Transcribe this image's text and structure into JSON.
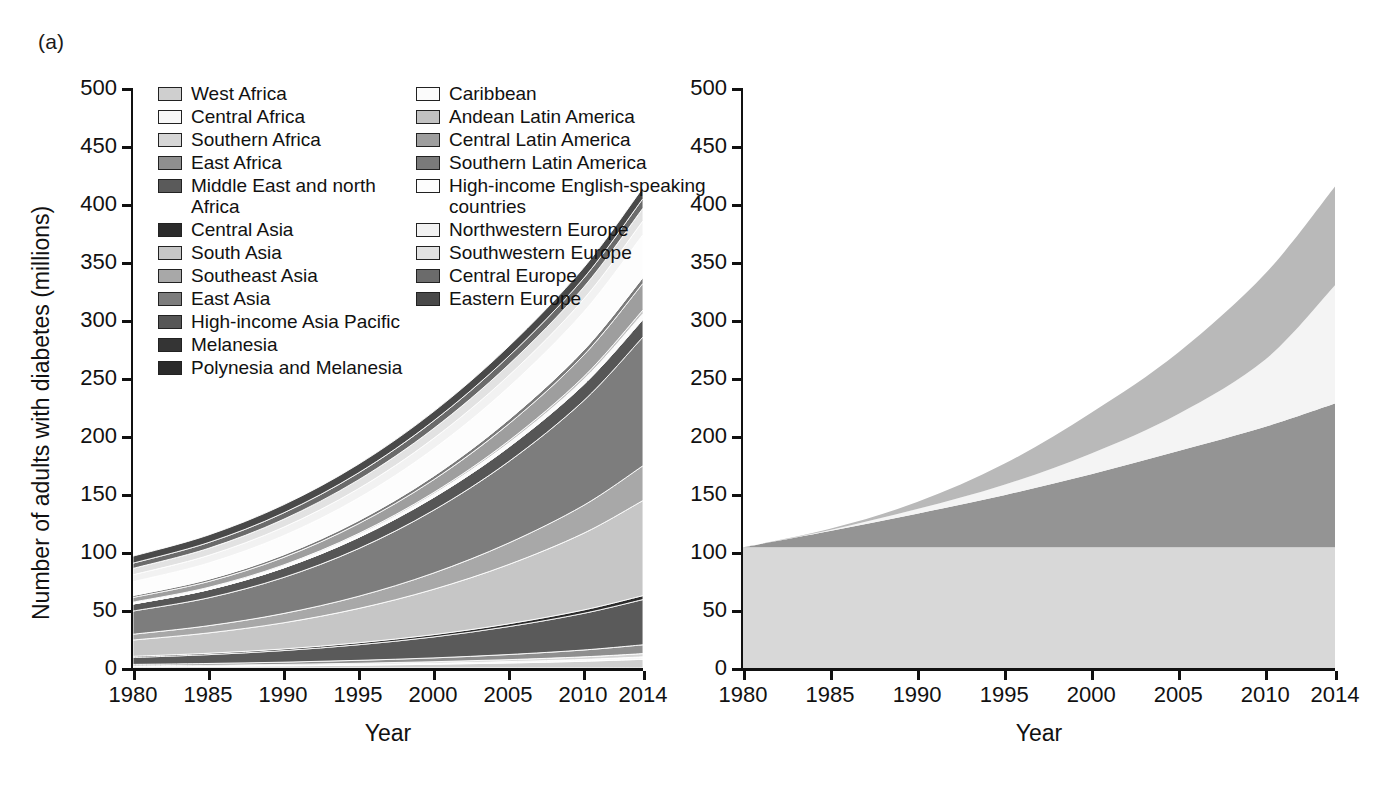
{
  "figure": {
    "panels": [
      {
        "tag": "(a)"
      },
      {
        "tag": "(b)"
      }
    ]
  },
  "panel_a": {
    "tag": "(a)",
    "ylabel": "Number of adults with diabetes (millions)",
    "xlabel": "Year",
    "yticks": [
      "0",
      "50",
      "100",
      "150",
      "200",
      "250",
      "300",
      "350",
      "400",
      "450",
      "500"
    ],
    "xticks": [
      "1980",
      "1985",
      "1990",
      "1995",
      "2000",
      "2005",
      "2010",
      "2014"
    ],
    "legend": [
      {
        "label": "West Africa",
        "color": "#cfcfcf"
      },
      {
        "label": "Central Africa",
        "color": "#f7f7f7"
      },
      {
        "label": "Southern Africa",
        "color": "#d6d6d6"
      },
      {
        "label": "East Africa",
        "color": "#8f8f8f"
      },
      {
        "label": "Middle East and north Africa",
        "color": "#5a5a5a"
      },
      {
        "label": "Central Asia",
        "color": "#2b2b2b"
      },
      {
        "label": "South Asia",
        "color": "#c6c6c6"
      },
      {
        "label": "Southeast Asia",
        "color": "#a8a8a8"
      },
      {
        "label": "East Asia",
        "color": "#7d7d7d"
      },
      {
        "label": "High-income Asia Pacific",
        "color": "#565656"
      },
      {
        "label": "Melanesia",
        "color": "#343434"
      },
      {
        "label": "Polynesia and Melanesia",
        "color": "#2a2a2a"
      },
      {
        "label": "Caribbean",
        "color": "#fbfbfb"
      },
      {
        "label": "Andean Latin America",
        "color": "#c2c2c2"
      },
      {
        "label": "Central Latin America",
        "color": "#9e9e9e"
      },
      {
        "label": "Southern Latin America",
        "color": "#7a7a7a"
      },
      {
        "label": "High-income English-speaking countries",
        "color": "#fdfdfd"
      },
      {
        "label": "Northwestern Europe",
        "color": "#f2f2f2"
      },
      {
        "label": "Southwestern Europe",
        "color": "#e2e2e2"
      },
      {
        "label": "Central Europe",
        "color": "#6b6b6b"
      },
      {
        "label": "Eastern Europe",
        "color": "#494949"
      }
    ]
  },
  "panel_b": {
    "tag": "(b)",
    "xlabel": "Year",
    "yticks": [
      "0",
      "50",
      "100",
      "150",
      "200",
      "250",
      "300",
      "350",
      "400",
      "450",
      "500"
    ],
    "xticks": [
      "1980",
      "1985",
      "1990",
      "1995",
      "2000",
      "2005",
      "2010",
      "2014"
    ],
    "legend": [
      {
        "label": "Change due to change in prevalence",
        "color": "#b9b9b9"
      },
      {
        "label": "Change due to interaction between change in prevalence\nand change in population size and age structure",
        "color": "#f4f4f4"
      },
      {
        "label": "Change due to change in population size and age structure",
        "color": "#949494"
      },
      {
        "label": "Number of adults with diabetes in 1980",
        "color": "#d8d8d8"
      }
    ]
  },
  "chart_data": {
    "type": "area",
    "title": "",
    "xlabel": "Year",
    "ylabel": "Number of adults with diabetes (millions)",
    "xlim": [
      1980,
      2014
    ],
    "ylim": [
      0,
      500
    ],
    "grid": false,
    "legend_position": "inside-top-left",
    "charts": [
      {
        "panel": "(a)",
        "type": "area",
        "stacked": true,
        "x": [
          1980,
          1985,
          1990,
          1995,
          2000,
          2005,
          2010,
          2014
        ],
        "total": [
          101,
          119,
          143,
          175,
          218,
          268,
          330,
          400
        ],
        "series": [
          {
            "name": "West Africa",
            "color": "#cfcfcf",
            "values": [
              1.1,
              1.4,
              1.8,
              2.4,
              3.2,
              4.3,
              5.8,
              7.5
            ]
          },
          {
            "name": "Central Africa",
            "color": "#f7f7f7",
            "values": [
              0.3,
              0.4,
              0.5,
              0.7,
              0.9,
              1.2,
              1.6,
              2.1
            ]
          },
          {
            "name": "Southern Africa",
            "color": "#d6d6d6",
            "values": [
              0.5,
              0.6,
              0.8,
              1.0,
              1.3,
              1.7,
              2.2,
              2.8
            ]
          },
          {
            "name": "East Africa",
            "color": "#8f8f8f",
            "values": [
              1.2,
              1.5,
              1.9,
              2.5,
              3.3,
              4.4,
              5.9,
              7.6
            ]
          },
          {
            "name": "Middle East and north Africa",
            "color": "#5a5a5a",
            "values": [
              6.0,
              7.6,
              10.0,
              13.4,
              18.0,
              24.0,
              31.5,
              39.0
            ]
          },
          {
            "name": "Central Asia",
            "color": "#2b2b2b",
            "values": [
              1.0,
              1.2,
              1.4,
              1.7,
              2.0,
              2.4,
              2.9,
              3.4
            ]
          },
          {
            "name": "South Asia",
            "color": "#c6c6c6",
            "values": [
              14.0,
              17.5,
              22.5,
              29.5,
              39.0,
              51.0,
              66.0,
              82.0
            ]
          },
          {
            "name": "Southeast Asia",
            "color": "#a8a8a8",
            "values": [
              5.0,
              6.2,
              8.0,
              10.5,
              14.0,
              18.5,
              24.0,
              30.0
            ]
          },
          {
            "name": "East Asia",
            "color": "#7d7d7d",
            "values": [
              20.0,
              24.0,
              31.0,
              41.0,
              54.0,
              70.0,
              90.0,
              111.0
            ]
          },
          {
            "name": "High-income Asia Pacific",
            "color": "#565656",
            "values": [
              6.0,
              7.0,
              8.2,
              9.6,
              11.0,
              12.4,
              13.8,
              15.0
            ]
          },
          {
            "name": "Melanesia",
            "color": "#343434",
            "values": [
              0.1,
              0.12,
              0.15,
              0.2,
              0.25,
              0.32,
              0.4,
              0.5
            ]
          },
          {
            "name": "Polynesia and Melanesia",
            "color": "#2a2a2a",
            "values": [
              0.08,
              0.1,
              0.12,
              0.15,
              0.19,
              0.24,
              0.3,
              0.37
            ]
          },
          {
            "name": "Caribbean",
            "color": "#fbfbfb",
            "values": [
              1.0,
              1.2,
              1.5,
              1.9,
              2.4,
              3.0,
              3.7,
              4.4
            ]
          },
          {
            "name": "Andean Latin America",
            "color": "#c2c2c2",
            "values": [
              0.5,
              0.6,
              0.8,
              1.1,
              1.4,
              1.9,
              2.4,
              3.0
            ]
          },
          {
            "name": "Central Latin America",
            "color": "#9e9e9e",
            "values": [
              4.0,
              5.0,
              6.5,
              8.5,
              11.0,
              14.5,
              18.5,
              23.0
            ]
          },
          {
            "name": "Southern Latin America",
            "color": "#7a7a7a",
            "values": [
              1.6,
              1.9,
              2.2,
              2.6,
              3.1,
              3.7,
              4.3,
              5.0
            ]
          },
          {
            "name": "High-income English-speaking countries",
            "color": "#fdfdfd",
            "values": [
              12.0,
              14.0,
              16.5,
              19.5,
              23.5,
              28.0,
              33.0,
              37.0
            ]
          },
          {
            "name": "Northwestern Europe",
            "color": "#f2f2f2",
            "values": [
              6.0,
              6.6,
              7.3,
              8.1,
              9.0,
              10.0,
              11.0,
              11.8
            ]
          },
          {
            "name": "Southwestern Europe",
            "color": "#e2e2e2",
            "values": [
              5.5,
              6.1,
              6.8,
              7.6,
              8.5,
              9.4,
              10.3,
              11.0
            ]
          },
          {
            "name": "Central Europe",
            "color": "#6b6b6b",
            "values": [
              4.5,
              5.0,
              5.5,
              6.0,
              6.6,
              7.2,
              7.8,
              8.3
            ]
          },
          {
            "name": "Eastern Europe",
            "color": "#494949",
            "values": [
              6.0,
              6.5,
              7.0,
              7.5,
              8.0,
              8.5,
              9.0,
              9.3
            ]
          }
        ]
      },
      {
        "panel": "(b)",
        "type": "area",
        "stacked": true,
        "x": [
          1980,
          1985,
          1990,
          1995,
          2000,
          2005,
          2010,
          2014
        ],
        "total": [
          104,
          120,
          143,
          176,
          220,
          272,
          340,
          415
        ],
        "series": [
          {
            "name": "Number of adults with diabetes in 1980",
            "color": "#d8d8d8",
            "values": [
              104,
              104,
              104,
              104,
              104,
              104,
              104,
              104
            ]
          },
          {
            "name": "Change due to change in population size and age structure",
            "color": "#949494",
            "values": [
              0,
              14,
              29,
              45,
              63,
              83,
              104,
              124
            ]
          },
          {
            "name": "Change due to interaction between change in prevalence and change in population size and age structure",
            "color": "#f4f4f4",
            "values": [
              0,
              1,
              4,
              9,
              18,
              32,
              58,
              102
            ]
          },
          {
            "name": "Change due to change in prevalence",
            "color": "#b9b9b9",
            "values": [
              0,
              1,
              6,
              18,
              35,
              53,
              74,
              85
            ]
          }
        ]
      }
    ]
  }
}
